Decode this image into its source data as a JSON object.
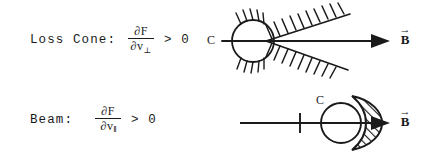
{
  "figure": {
    "rows": [
      {
        "id": "loss-cone",
        "name": "Loss Cone",
        "label": "Loss Cone:",
        "derivative": {
          "numerator": "∂F",
          "denominator_symbol": "∂v",
          "denominator_subscript": "⊥",
          "subscript_meaning": "perpendicular"
        },
        "inequality": "> 0",
        "diagram": {
          "type": "loss-cone-velocity-space",
          "circle_label": "C",
          "vector_label": "B",
          "vector_accent": "→",
          "hatching": "perpendicular-tick-hatching-on-cone-boundaries",
          "cone_opening": "rightward"
        }
      },
      {
        "id": "beam",
        "name": "Beam",
        "label": "Beam:",
        "derivative": {
          "numerator": "∂F",
          "denominator_symbol": "∂v",
          "denominator_subscript": "‖",
          "subscript_meaning": "parallel"
        },
        "inequality": "> 0",
        "diagram": {
          "type": "beam-velocity-space",
          "circle_label": "C",
          "vector_label": "B",
          "vector_accent": "→",
          "hatching": "diagonal-hatched-crescent",
          "tick_mark": "short-vertical-tick-on-axis"
        }
      }
    ],
    "colors": {
      "ink": "#1a1a1a",
      "background": "#ffffff"
    }
  }
}
